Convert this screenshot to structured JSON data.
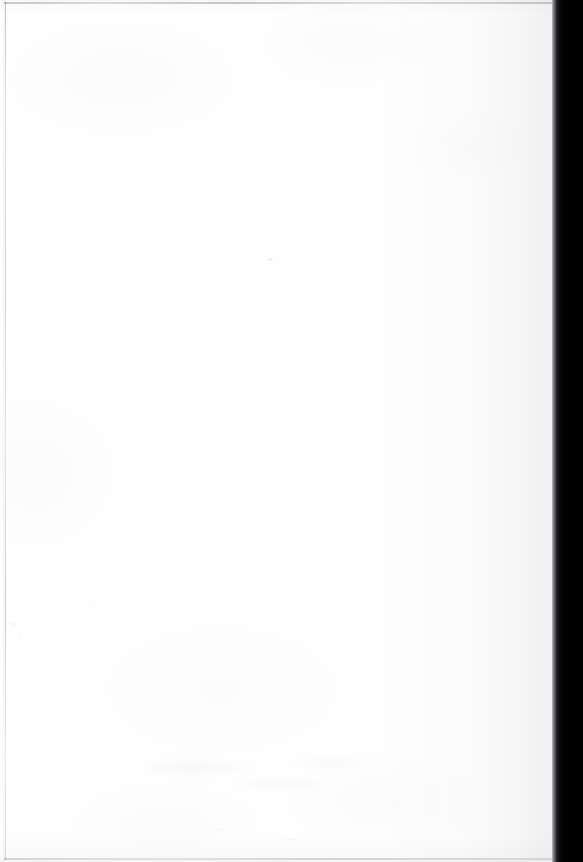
{
  "document": {
    "kind": "scanned-blank-page",
    "page_content_text": "",
    "visible_text": [],
    "canvas": {
      "width_px": 583,
      "height_px": 862
    }
  },
  "paper": {
    "name": "paper-surface",
    "background_color": "#fefefe",
    "left_px": 0,
    "top_px": 0,
    "width_px": 553,
    "height_px": 862
  },
  "gutter": {
    "name": "scanner-gutter",
    "color": "#000000",
    "edge_highlight_color": "#b9bcc0",
    "left_px": 552,
    "width_px": 31
  },
  "edges": {
    "top_rule_color": "#cfcfcf",
    "bottom_rule_color": "#d8d8d8",
    "left_rule_color": "#c8c8c8",
    "left_rule_x_px": 5
  },
  "artifacts": {
    "bleed_through_text": "",
    "bleed_through_opacity": "0.055",
    "dust_speck_count": 7
  }
}
